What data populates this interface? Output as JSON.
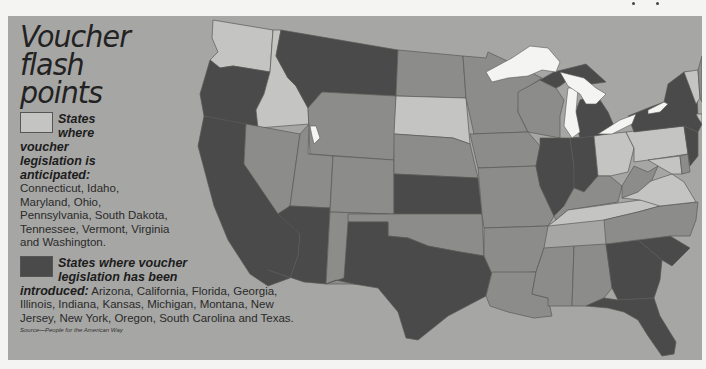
{
  "title": "Voucher flash points",
  "title_lines": [
    "Voucher",
    "flash",
    "points"
  ],
  "legend": {
    "anticipated": {
      "heading": "States where voucher legislation is anticipated:",
      "heading_lines": [
        "States",
        "where",
        "voucher",
        "legislation is",
        "anticipated:"
      ],
      "states_text": "Connecticut, Idaho, Maryland, Ohio, Pennsylvania, South Dakota, Tennessee, Vermont, Virginia and Washington.",
      "color": "#c4c4c2",
      "states": [
        "Connecticut",
        "Idaho",
        "Maryland",
        "Ohio",
        "Pennsylvania",
        "South Dakota",
        "Tennessee",
        "Vermont",
        "Virginia",
        "Washington"
      ]
    },
    "introduced": {
      "heading": "States where voucher legislation has been introduced:",
      "heading_line1": "States where voucher",
      "heading_line2": "legislation has been",
      "heading_line3": "introduced:",
      "states_text": "Arizona, California, Florida, Georgia, Illinois, Indiana, Kansas, Michigan, Montana, New Jersey, New York, Oregon, South Carolina and Texas.",
      "color": "#4a4a4a",
      "states": [
        "Arizona",
        "California",
        "Florida",
        "Georgia",
        "Illinois",
        "Indiana",
        "Kansas",
        "Michigan",
        "Montana",
        "New Jersey",
        "New York",
        "Oregon",
        "South Carolina",
        "Texas"
      ]
    },
    "other_color": "#8c8c8a",
    "water_color": "#f4f4f2"
  },
  "source": "Source—People for the American Way",
  "map": {
    "background": "#a6a6a4",
    "states": {
      "WA": "light",
      "OR": "dark",
      "CA": "dark",
      "ID": "light",
      "NV": "other",
      "MT": "dark",
      "WY": "other",
      "UT": "other",
      "AZ": "dark",
      "CO": "other",
      "NM": "other",
      "ND": "other",
      "SD": "light",
      "NE": "other",
      "KS": "dark",
      "OK": "other",
      "TX": "dark",
      "MN": "other",
      "IA": "other",
      "MO": "other",
      "AR": "other",
      "LA": "other",
      "WI": "other",
      "IL": "dark",
      "MI": "dark",
      "IN": "dark",
      "OH": "light",
      "KY": "other",
      "TN": "light",
      "MS": "other",
      "AL": "other",
      "GA": "dark",
      "FL": "dark",
      "SC": "dark",
      "NC": "other",
      "VA": "light",
      "WV": "other",
      "PA": "light",
      "NY": "dark",
      "NJ": "dark",
      "MD": "light",
      "DE": "other",
      "VT": "light",
      "NH": "other",
      "ME": "other",
      "MA": "other",
      "CT": "light",
      "RI": "other"
    }
  }
}
